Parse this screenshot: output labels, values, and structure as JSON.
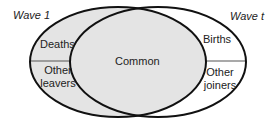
{
  "diagram": {
    "type": "venn",
    "sets": [
      {
        "name": "Wave 1",
        "subregions": [
          "Deaths",
          "Other leavers"
        ]
      },
      {
        "name": "Wave t",
        "subregions": [
          "Births",
          "Other joiners"
        ]
      }
    ],
    "intersection": "Common"
  },
  "labels": {
    "wave1": "Wave 1",
    "wavet": "Wave t",
    "deaths": "Deaths",
    "other_leavers_1": "Other",
    "other_leavers_2": "leavers",
    "common": "Common",
    "births": "Births",
    "other_joiners_1": "Other",
    "other_joiners_2": "joiners"
  },
  "colors": {
    "shade": "#e4e4e4",
    "stroke": "#111111",
    "background": "#ffffff"
  }
}
